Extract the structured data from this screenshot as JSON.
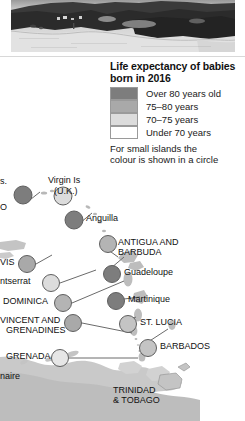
{
  "photo": {
    "alt_name": "caribbean-coastline-photo",
    "description": "Grayscale aerial photograph of a beach coastline with dark vegetation"
  },
  "legend": {
    "title_line1": "Life expectancy of babies",
    "title_line2": "born in 2016",
    "items": [
      {
        "label": "Over 80 years old",
        "color": "#7d7d7d"
      },
      {
        "label": "75–80 years",
        "color": "#a9a9a9"
      },
      {
        "label": "70–75 years",
        "color": "#dcdcdc"
      },
      {
        "label": "Under 70 years",
        "color": "#ffffff"
      }
    ],
    "note_line1": "For small islands the",
    "note_line2": "colour is shown in a circle"
  },
  "map": {
    "name": "caribbean-lesser-antilles-map",
    "sea_color": "#ffffff",
    "land_color": "#c9c9c9",
    "island_color": "#bdbdbd",
    "leader_color": "#6b6b6b",
    "labels": [
      {
        "id": "virgin-is-us",
        "text": "s.",
        "x": 0,
        "y": 181
      },
      {
        "id": "puerto-rico",
        "text": "O",
        "x": 0,
        "y": 206
      },
      {
        "id": "virgin-is-uk-1",
        "text": "Virgin Is",
        "x": 48,
        "y": 180
      },
      {
        "id": "virgin-is-uk-2",
        "text": "(U.K.)",
        "x": 54,
        "y": 190
      },
      {
        "id": "anguilla",
        "text": "Anguilla",
        "x": 85,
        "y": 215
      },
      {
        "id": "antigua-1",
        "text": "ANTIGUA AND",
        "x": 117,
        "y": 239
      },
      {
        "id": "antigua-2",
        "text": "BARBUDA",
        "x": 117,
        "y": 249
      },
      {
        "id": "nevis",
        "text": "VIS",
        "x": 0,
        "y": 259
      },
      {
        "id": "guadeloupe",
        "text": "Guadeloupe",
        "x": 123,
        "y": 270
      },
      {
        "id": "montserrat",
        "text": "ntserrat",
        "x": 0,
        "y": 278
      },
      {
        "id": "dominica",
        "text": "DOMINICA",
        "x": 3,
        "y": 299
      },
      {
        "id": "martinique",
        "text": "Martinique",
        "x": 127,
        "y": 297
      },
      {
        "id": "st-vincent-1",
        "text": "VINCENT AND",
        "x": 0,
        "y": 318
      },
      {
        "id": "st-vincent-2",
        "text": "GRENADINES",
        "x": 5,
        "y": 328
      },
      {
        "id": "st-lucia",
        "text": "ST. LUCIA",
        "x": 139,
        "y": 320
      },
      {
        "id": "barbados",
        "text": "BARBADOS",
        "x": 159,
        "y": 344
      },
      {
        "id": "grenada",
        "text": "GRENADA",
        "x": 5,
        "y": 354
      },
      {
        "id": "bonaire",
        "text": "naire",
        "x": 0,
        "y": 374
      },
      {
        "id": "trinidad-1",
        "text": "TRINIDAD",
        "x": 112,
        "y": 388
      },
      {
        "id": "trinidad-2",
        "text": "& TOBAGO",
        "x": 112,
        "y": 398
      }
    ],
    "circles": [
      {
        "id": "circle-virgin-is-us",
        "cx": 23,
        "cy": 195,
        "r": 9,
        "color": "#7d7d7d"
      },
      {
        "id": "circle-virgin-is-uk",
        "cx": 63,
        "cy": 196,
        "r": 9,
        "color": "#dcdcdc"
      },
      {
        "id": "circle-anguilla",
        "cx": 74,
        "cy": 220,
        "r": 9,
        "color": "#7d7d7d"
      },
      {
        "id": "circle-antigua",
        "cx": 108,
        "cy": 244,
        "r": 8.5,
        "color": "#b4b4b4"
      },
      {
        "id": "circle-nevis",
        "cx": 27,
        "cy": 264,
        "r": 8.5,
        "color": "#a9a9a9"
      },
      {
        "id": "circle-guadeloupe",
        "cx": 112,
        "cy": 274,
        "r": 8.5,
        "color": "#7d7d7d"
      },
      {
        "id": "circle-montserrat",
        "cx": 51,
        "cy": 283,
        "r": 8.5,
        "color": "#dcdcdc"
      },
      {
        "id": "circle-dominica",
        "cx": 63,
        "cy": 303,
        "r": 8.5,
        "color": "#b4b4b4"
      },
      {
        "id": "circle-martinique",
        "cx": 116,
        "cy": 301,
        "r": 8.5,
        "color": "#7d7d7d"
      },
      {
        "id": "circle-st-vincent",
        "cx": 73,
        "cy": 323,
        "r": 8.5,
        "color": "#a9a9a9"
      },
      {
        "id": "circle-st-lucia",
        "cx": 128,
        "cy": 324,
        "r": 8.5,
        "color": "#c4c4c4"
      },
      {
        "id": "circle-barbados",
        "cx": 148,
        "cy": 348,
        "r": 8.5,
        "color": "#c4c4c4"
      },
      {
        "id": "circle-grenada",
        "cx": 60,
        "cy": 358,
        "r": 8.5,
        "color": "#e6e6e6"
      }
    ]
  }
}
